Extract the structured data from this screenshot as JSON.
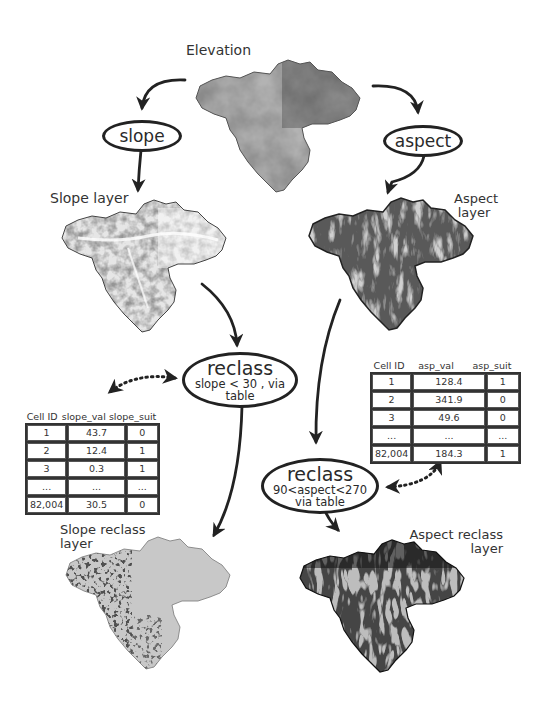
{
  "diagram": {
    "nodes": {
      "elevation": {
        "label": "Elevation"
      },
      "slope_op": {
        "label": "slope"
      },
      "aspect_op": {
        "label": "aspect"
      },
      "slope_layer": {
        "label": "Slope layer"
      },
      "aspect_layer": {
        "label_line1": "Aspect",
        "label_line2": "layer"
      },
      "slope_reclass_op": {
        "label": "reclass",
        "condition_line1": "slope < 30 , via",
        "condition_line2": "table"
      },
      "aspect_reclass_op": {
        "label": "reclass",
        "condition_line1": "90<aspect<270",
        "condition_line2": "via table"
      },
      "slope_reclass_layer": {
        "label_line1": "Slope reclass",
        "label_line2": "layer"
      },
      "aspect_reclass_layer": {
        "label_line1": "Aspect reclass",
        "label_line2": "layer"
      }
    },
    "edges": [
      {
        "from": "elevation",
        "to": "slope_op",
        "style": "solid"
      },
      {
        "from": "elevation",
        "to": "aspect_op",
        "style": "solid"
      },
      {
        "from": "slope_op",
        "to": "slope_layer",
        "style": "solid"
      },
      {
        "from": "aspect_op",
        "to": "aspect_layer",
        "style": "solid"
      },
      {
        "from": "slope_layer",
        "to": "slope_reclass_op",
        "style": "solid"
      },
      {
        "from": "aspect_layer",
        "to": "aspect_reclass_op",
        "style": "solid"
      },
      {
        "from": "slope_reclass_op",
        "to": "slope_table",
        "style": "dotted",
        "bidirectional": true
      },
      {
        "from": "aspect_reclass_op",
        "to": "aspect_table",
        "style": "dotted",
        "bidirectional": true
      },
      {
        "from": "slope_reclass_op",
        "to": "slope_reclass_layer",
        "style": "solid"
      },
      {
        "from": "aspect_reclass_op",
        "to": "aspect_reclass_layer",
        "style": "solid"
      }
    ]
  },
  "slope_table": {
    "headers": [
      "Cell ID",
      "slope_val",
      "slope_suit"
    ],
    "rows": [
      [
        "1",
        "43.7",
        "0"
      ],
      [
        "2",
        "12.4",
        "1"
      ],
      [
        "3",
        "0.3",
        "1"
      ],
      [
        "...",
        "...",
        "..."
      ],
      [
        "82,004",
        "30.5",
        "0"
      ]
    ]
  },
  "aspect_table": {
    "headers": [
      "Cell ID",
      "asp_val",
      "asp_suit"
    ],
    "rows": [
      [
        "1",
        "128.4",
        "1"
      ],
      [
        "2",
        "341.9",
        "0"
      ],
      [
        "3",
        "49.6",
        "0"
      ],
      [
        "...",
        "...",
        "..."
      ],
      [
        "82,004",
        "184.3",
        "1"
      ]
    ]
  },
  "colors": {
    "line": "#222222",
    "elevation_light": "#b8b8b8",
    "elevation_dark": "#5a5a5a",
    "reclass_gray": "#c4c4c4",
    "reclass_black": "#141414"
  }
}
